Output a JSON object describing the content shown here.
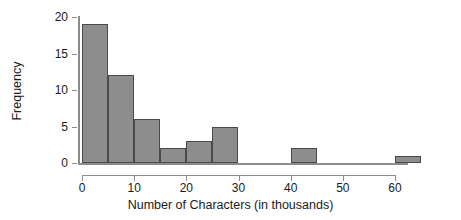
{
  "chart_data": {
    "type": "bar",
    "title": "",
    "xlabel": "Number of Characters (in thousands)",
    "ylabel": "Frequency",
    "xlim": [
      0,
      65
    ],
    "ylim": [
      0,
      20
    ],
    "grid": false,
    "legend": false,
    "bin_width": 5,
    "bin_edges": [
      0,
      5,
      10,
      15,
      20,
      25,
      30,
      35,
      40,
      45,
      50,
      55,
      60,
      65
    ],
    "categories": [
      "0-5",
      "5-10",
      "10-15",
      "15-20",
      "20-25",
      "25-30",
      "30-35",
      "35-40",
      "40-45",
      "45-50",
      "50-55",
      "55-60",
      "60-65"
    ],
    "values": [
      19,
      12,
      6,
      2,
      3,
      5,
      0,
      0,
      2,
      0,
      0,
      0,
      1
    ],
    "bars": [
      {
        "start": 0,
        "end": 5,
        "value": 19
      },
      {
        "start": 5,
        "end": 10,
        "value": 12
      },
      {
        "start": 10,
        "end": 15,
        "value": 6
      },
      {
        "start": 15,
        "end": 20,
        "value": 2
      },
      {
        "start": 20,
        "end": 25,
        "value": 3
      },
      {
        "start": 25,
        "end": 30,
        "value": 5
      },
      {
        "start": 40,
        "end": 45,
        "value": 2
      },
      {
        "start": 60,
        "end": 65,
        "value": 1
      }
    ],
    "x_ticks": [
      0,
      10,
      20,
      30,
      40,
      50,
      60
    ],
    "x_tick_labels": [
      "0",
      "10",
      "20",
      "30",
      "40",
      "50",
      "60"
    ],
    "y_ticks": [
      0,
      5,
      10,
      15,
      20
    ],
    "y_tick_labels": [
      "0",
      "5",
      "10",
      "15",
      "20"
    ],
    "colors": {
      "bar_fill": "#8d8d8d",
      "bar_edge": "#4a4a4a",
      "axis": "#8c8c8c",
      "text": "#1a1a1a",
      "background": "#ffffff"
    }
  }
}
